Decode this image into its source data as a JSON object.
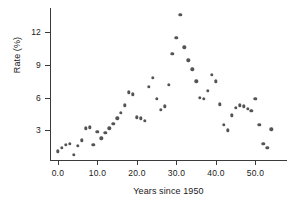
{
  "chart_data": {
    "type": "scatter",
    "title": "",
    "xlabel": "Years since 1950",
    "ylabel": "Rate (%)",
    "xlim": [
      -2.0,
      58.0
    ],
    "ylim": [
      0.3,
      14.2
    ],
    "xticks": [
      0,
      10,
      20,
      30,
      40,
      50
    ],
    "xticklabels": [
      "0.0",
      "10.0",
      "20.0",
      "30.0",
      "40.0",
      "50.0"
    ],
    "yticks": [
      3,
      6,
      9,
      12
    ],
    "yticklabels": [
      "3",
      "6",
      "9",
      "12"
    ],
    "grid": false,
    "legend": null,
    "marker_color": "#545454",
    "axis_color": "#3a3a3a",
    "background": "#ffffff",
    "x": [
      0.0,
      1.0,
      2.0,
      3.0,
      4.0,
      5.0,
      6.0,
      7.0,
      8.0,
      9.0,
      10.0,
      11.0,
      12.0,
      13.0,
      14.0,
      15.0,
      16.0,
      17.0,
      18.0,
      19.0,
      20.0,
      21.0,
      22.0,
      23.0,
      24.0,
      25.0,
      26.0,
      27.0,
      28.0,
      29.0,
      30.0,
      31.0,
      32.0,
      33.0,
      34.0,
      35.0,
      36.0,
      37.0,
      38.0,
      39.0,
      40.0,
      41.0,
      42.0,
      43.0,
      44.0,
      45.0,
      46.0,
      47.0,
      48.0,
      49.0,
      50.0,
      51.0,
      52.0,
      53.0,
      54.0
    ],
    "y": [
      1.1,
      1.4,
      1.7,
      1.8,
      0.8,
      1.6,
      2.1,
      3.2,
      3.3,
      1.7,
      2.9,
      2.3,
      2.8,
      3.2,
      3.6,
      4.1,
      4.6,
      5.3,
      6.5,
      6.3,
      4.2,
      4.1,
      3.9,
      7.0,
      7.8,
      5.9,
      4.9,
      5.2,
      7.2,
      10.0,
      11.5,
      13.6,
      10.6,
      9.4,
      8.6,
      7.5,
      6.0,
      5.9,
      6.6,
      8.1,
      7.5,
      5.4,
      3.5,
      3.0,
      4.4,
      5.1,
      5.3,
      5.2,
      5.0,
      4.8,
      5.9,
      3.5,
      1.8,
      1.4,
      3.1
    ]
  }
}
